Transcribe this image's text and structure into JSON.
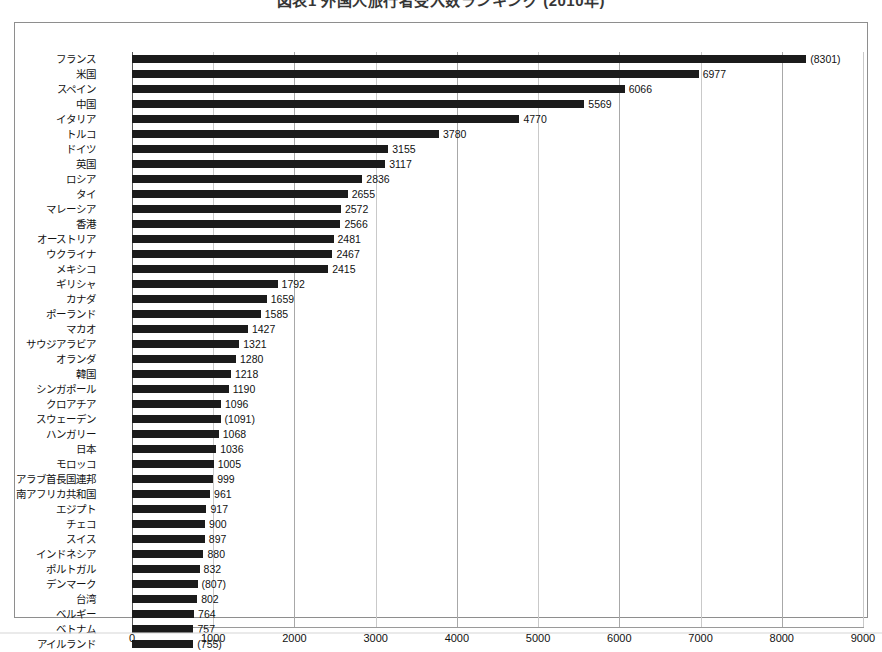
{
  "title": "図表1 外国人旅行者受入数ランキング (2010年)",
  "chart_data": {
    "type": "bar",
    "orientation": "horizontal",
    "title": "図表1 外国人旅行者受入数ランキング (2010年)",
    "xlabel": "",
    "ylabel": "",
    "xlim": [
      0,
      9000
    ],
    "xticks": [
      0,
      1000,
      2000,
      3000,
      4000,
      5000,
      6000,
      7000,
      8000,
      9000
    ],
    "grid": true,
    "legend": "none",
    "bar_color": "#1b1b1b",
    "categories": [
      "フランス",
      "米国",
      "スペイン",
      "中国",
      "イタリア",
      "トルコ",
      "ドイツ",
      "英国",
      "ロシア",
      "タイ",
      "マレーシア",
      "香港",
      "オーストリア",
      "ウクライナ",
      "メキシコ",
      "ギリシャ",
      "カナダ",
      "ポーランド",
      "マカオ",
      "サウジアラビア",
      "オランダ",
      "韓国",
      "シンガポール",
      "クロアチア",
      "スウェーデン",
      "ハンガリー",
      "日本",
      "モロッコ",
      "アラブ首長国連邦",
      "南アフリカ共和国",
      "エジプト",
      "チェコ",
      "スイス",
      "インドネシア",
      "ポルトガル",
      "デンマーク",
      "台湾",
      "ベルギー",
      "ベトナム",
      "アイルランド"
    ],
    "values": [
      8301,
      6977,
      6066,
      5569,
      4770,
      3780,
      3155,
      3117,
      2836,
      2655,
      2572,
      2566,
      2481,
      2467,
      2415,
      1792,
      1659,
      1585,
      1427,
      1321,
      1280,
      1218,
      1190,
      1096,
      1091,
      1068,
      1036,
      1005,
      999,
      961,
      917,
      900,
      897,
      880,
      832,
      807,
      802,
      764,
      757,
      755
    ],
    "value_labels": [
      "(8301)",
      "6977",
      "6066",
      "5569",
      "4770",
      "3780",
      "3155",
      "3117",
      "2836",
      "2655",
      "2572",
      "2566",
      "2481",
      "2467",
      "2415",
      "1792",
      "1659",
      "1585",
      "1427",
      "1321",
      "1280",
      "1218",
      "1190",
      "1096",
      "(1091)",
      "1068",
      "1036",
      "1005",
      "999",
      "961",
      "917",
      "900",
      "897",
      "880",
      "832",
      "(807)",
      "802",
      "764",
      "757",
      "(755)"
    ]
  }
}
